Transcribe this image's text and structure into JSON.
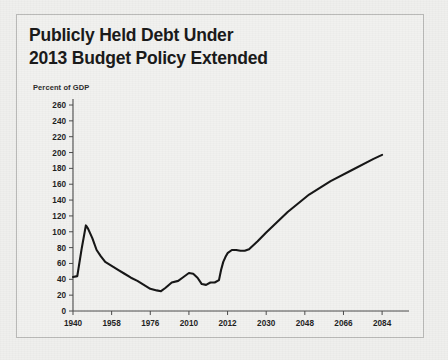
{
  "figure": {
    "title": "Publicly Held Debt Under\n2013 Budget Policy Extended",
    "axis_note": "Percent of GDP",
    "border_color": "#b9b9b7",
    "background_color": "#efefed",
    "series_color": "#141414"
  },
  "chart_data": {
    "type": "line",
    "title": "Publicly Held Debt Under 2013 Budget Policy Extended",
    "subtitle": "",
    "xlabel": "",
    "ylabel": "Percent of GDP",
    "ylim": [
      0,
      260
    ],
    "ytick_labels": [
      "0",
      "20",
      "40",
      "60",
      "80",
      "100",
      "120",
      "140",
      "160",
      "180",
      "200",
      "220",
      "240",
      "260"
    ],
    "ytick_values": [
      0,
      20,
      40,
      60,
      80,
      100,
      120,
      140,
      160,
      180,
      200,
      220,
      240,
      260
    ],
    "xtick_labels": [
      "1940",
      "1958",
      "1976",
      "2010",
      "2012",
      "2030",
      "2048",
      "2066",
      "2084"
    ],
    "xtick_values": [
      1940,
      1958,
      1976,
      1994,
      2012,
      2030,
      2048,
      2066,
      2084
    ],
    "xlim": [
      1940,
      2090
    ],
    "grid": false,
    "legend": "none",
    "annotations": [],
    "series": [
      {
        "name": "Publicly held debt (percent of GDP)",
        "x": [
          1940,
          1942,
          1944,
          1946,
          1947,
          1949,
          1951,
          1953,
          1955,
          1958,
          1961,
          1964,
          1967,
          1970,
          1973,
          1976,
          1979,
          1981,
          1983,
          1986,
          1989,
          1991,
          1994,
          1996,
          1998,
          2000,
          2002,
          2004,
          2006,
          2008,
          2009,
          2010,
          2011,
          2012,
          2014,
          2016,
          2018,
          2020,
          2022,
          2026,
          2030,
          2040,
          2050,
          2060,
          2070,
          2080,
          2084
        ],
        "values": [
          43,
          44,
          78,
          108,
          104,
          92,
          77,
          69,
          62,
          57,
          52,
          47,
          42,
          38,
          33,
          28,
          26,
          25,
          29,
          36,
          38,
          42,
          48,
          47,
          42,
          34,
          33,
          36,
          36,
          39,
          52,
          62,
          68,
          73,
          77,
          77,
          76,
          76,
          78,
          88,
          99,
          125,
          147,
          164,
          178,
          192,
          197
        ]
      }
    ]
  }
}
